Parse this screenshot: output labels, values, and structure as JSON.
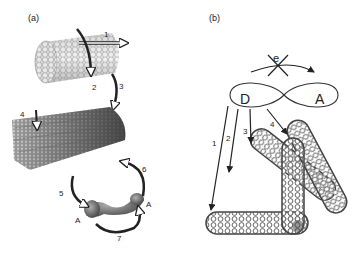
{
  "panel_a": {
    "label": "(a)",
    "arrows": [
      "1",
      "2",
      "3",
      "4",
      "5",
      "6",
      "7"
    ],
    "molecule_labels": [
      "A",
      "A"
    ]
  },
  "panel_b": {
    "label": "(b)",
    "electron_label": "e",
    "donor_label": "D",
    "acceptor_label": "A",
    "arrows": [
      "1",
      "2",
      "3",
      "4"
    ]
  },
  "colors": {
    "ink": "#222222",
    "tube_light": "#9a9a9a",
    "tube_dark": "#3a3a3a",
    "arrow_fill": "#ffffff"
  }
}
